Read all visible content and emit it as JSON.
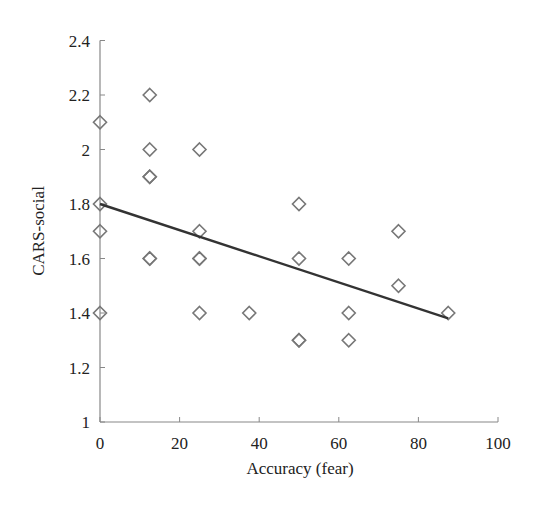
{
  "chart_data": {
    "type": "scatter",
    "title": "",
    "xlabel": "Accuracy (fear)",
    "ylabel": "CARS-social",
    "xlim": [
      0,
      100
    ],
    "ylim": [
      1,
      2.4
    ],
    "xticks": [
      0,
      20,
      40,
      60,
      80,
      100
    ],
    "yticks": [
      1,
      1.2,
      1.4,
      1.6,
      1.8,
      2,
      2.2,
      2.4
    ],
    "xtick_labels": [
      "0",
      "20",
      "40",
      "60",
      "80",
      "100"
    ],
    "ytick_labels": [
      "1",
      "1.2",
      "1.4",
      "1.6",
      "1.8",
      "2",
      "2.2",
      "2.4"
    ],
    "grid": false,
    "legend": null,
    "marker": "open-diamond",
    "marker_color": "#777777",
    "line_color": "#333333",
    "series": [
      {
        "name": "participants",
        "points": [
          {
            "x": 0,
            "y": 2.1
          },
          {
            "x": 0,
            "y": 1.8
          },
          {
            "x": 0,
            "y": 1.7
          },
          {
            "x": 0,
            "y": 1.4
          },
          {
            "x": 12.5,
            "y": 2.2
          },
          {
            "x": 12.5,
            "y": 2.0
          },
          {
            "x": 12.5,
            "y": 1.9
          },
          {
            "x": 12.5,
            "y": 1.9
          },
          {
            "x": 12.5,
            "y": 1.6
          },
          {
            "x": 12.5,
            "y": 1.6
          },
          {
            "x": 25,
            "y": 2.0
          },
          {
            "x": 25,
            "y": 1.7
          },
          {
            "x": 25,
            "y": 1.6
          },
          {
            "x": 25,
            "y": 1.6
          },
          {
            "x": 25,
            "y": 1.4
          },
          {
            "x": 37.5,
            "y": 1.4
          },
          {
            "x": 50,
            "y": 1.8
          },
          {
            "x": 50,
            "y": 1.6
          },
          {
            "x": 50,
            "y": 1.3
          },
          {
            "x": 50,
            "y": 1.3
          },
          {
            "x": 62.5,
            "y": 1.6
          },
          {
            "x": 62.5,
            "y": 1.4
          },
          {
            "x": 62.5,
            "y": 1.3
          },
          {
            "x": 75,
            "y": 1.7
          },
          {
            "x": 75,
            "y": 1.5
          },
          {
            "x": 87.5,
            "y": 1.4
          }
        ]
      }
    ],
    "trendline": {
      "x1": 0,
      "y1": 1.8,
      "x2": 87.5,
      "y2": 1.38
    }
  }
}
